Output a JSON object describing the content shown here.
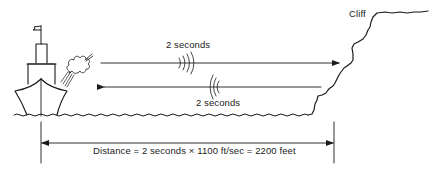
{
  "diagram": {
    "type": "echo-sounding illustration",
    "labels": {
      "cliff": "Cliff",
      "outgoing_time": "2 seconds",
      "return_time": "2 seconds",
      "distance_formula": "Distance = 2 seconds × 1100 ft/sec = 2200 feet"
    },
    "elements": {
      "ship": "ship-with-smoke-from-horn",
      "outgoing_sound": "arrow-toward-cliff-with-sound-waves",
      "echo_sound": "arrow-toward-ship-with-sound-waves",
      "distance_dimension": "double-ended-dimension-arrow"
    },
    "values": {
      "time_seconds": 2,
      "speed_of_sound_ft_per_sec": 1100,
      "distance_feet": 2200
    },
    "colors": {
      "ink": "#1a1a1a",
      "background": "#ffffff"
    }
  }
}
